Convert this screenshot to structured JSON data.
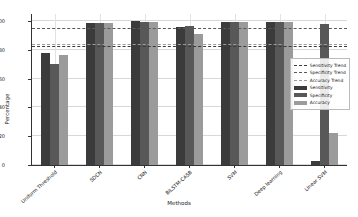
{
  "chart_data": {
    "type": "bar",
    "title": "",
    "xlabel": "Methods",
    "ylabel": "Percentage",
    "ylim": [
      0,
      105
    ],
    "yticks": [
      0,
      20,
      40,
      60,
      80,
      100
    ],
    "grid": true,
    "legend_position": "center-right",
    "categories": [
      "Uniform Threshold",
      "SDCN",
      "CNN",
      "BiLSTM-CASB",
      "SVM",
      "Deep learning",
      "Linear SVM"
    ],
    "series": [
      {
        "name": "Sensitivity",
        "color": "#3b3b3b",
        "values": [
          78,
          98.5,
          100,
          96,
          99.5,
          99.5,
          3
        ]
      },
      {
        "name": "Specificity",
        "color": "#585858",
        "values": [
          70,
          98.5,
          99.5,
          96.5,
          99.5,
          99.5,
          98
        ]
      },
      {
        "name": "Accuracy",
        "color": "#9b9b9b",
        "values": [
          76.5,
          99,
          99.5,
          91,
          99.5,
          99.5,
          22
        ]
      }
    ],
    "trend_lines": [
      {
        "name": "Sensitivity Trend",
        "value": 82,
        "color": "#3b3b3b"
      },
      {
        "name": "Specificity Trend",
        "value": 94.5,
        "color": "#585858"
      },
      {
        "name": "Accuracy Trend",
        "value": 83.5,
        "color": "#9b9b9b"
      }
    ],
    "legend": [
      {
        "label": "Sensitivity Trend",
        "kind": "line",
        "color": "#3b3b3b"
      },
      {
        "label": "Specificity Trend",
        "kind": "line",
        "color": "#585858"
      },
      {
        "label": "Accuracy Trend",
        "kind": "line",
        "color": "#9b9b9b"
      },
      {
        "label": "Sensitivity",
        "kind": "patch",
        "color": "#3b3b3b"
      },
      {
        "label": "Specificity",
        "kind": "patch",
        "color": "#585858"
      },
      {
        "label": "Accuracy",
        "kind": "patch",
        "color": "#9b9b9b"
      }
    ]
  }
}
